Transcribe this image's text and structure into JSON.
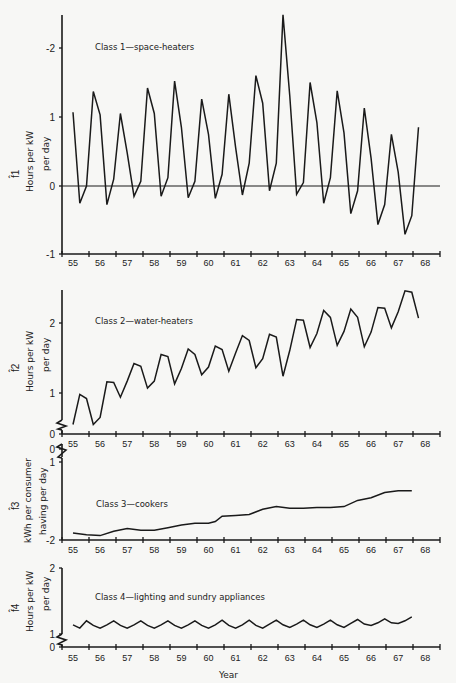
{
  "figure": {
    "xlabel": "Year",
    "years": [
      "55",
      "56",
      "57",
      "58",
      "59",
      "60",
      "61",
      "62",
      "63",
      "64",
      "65",
      "66",
      "67",
      "68"
    ]
  },
  "chart_data": [
    {
      "type": "line",
      "title": "Class 1—space-heaters",
      "ylabel": "Hours per kW per day",
      "ysymbol": "f̂1",
      "yticks": [
        "-2",
        "1",
        "0",
        "-1"
      ],
      "ytick_values": [
        2,
        1,
        0,
        -1
      ],
      "ylim": [
        -1,
        2.5
      ],
      "zero_line": true,
      "x": [
        55.0,
        55.25,
        55.5,
        55.75,
        56.0,
        56.25,
        56.5,
        56.75,
        57.0,
        57.25,
        57.5,
        57.75,
        58.0,
        58.25,
        58.5,
        58.75,
        59.0,
        59.25,
        59.5,
        59.75,
        60.0,
        60.25,
        60.5,
        60.75,
        61.0,
        61.25,
        61.5,
        61.75,
        62.0,
        62.25,
        62.5,
        62.75,
        63.0,
        63.25,
        63.5,
        63.75,
        64.0,
        64.25,
        64.5,
        64.75,
        65.0,
        65.25,
        65.5,
        65.75,
        66.0,
        66.25,
        66.5,
        66.75,
        67.0,
        67.25,
        67.5
      ],
      "values": [
        1.07,
        -0.25,
        0.0,
        1.37,
        1.03,
        -0.27,
        0.1,
        1.05,
        0.48,
        -0.15,
        0.07,
        1.42,
        1.05,
        -0.15,
        0.12,
        1.52,
        0.85,
        -0.17,
        0.07,
        1.26,
        0.75,
        -0.18,
        0.17,
        1.33,
        0.56,
        -0.13,
        0.33,
        1.6,
        1.2,
        -0.07,
        0.33,
        2.48,
        1.3,
        -0.12,
        0.05,
        1.5,
        0.92,
        -0.25,
        0.12,
        1.38,
        0.77,
        -0.4,
        -0.07,
        1.13,
        0.4,
        -0.56,
        -0.27,
        0.75,
        0.2,
        -0.7,
        -0.43,
        0.85
      ]
    },
    {
      "type": "line",
      "title": "Class 2—water-heaters",
      "ylabel": "Hours per kW per day",
      "ysymbol": "f̂2",
      "yticks": [
        "2",
        "1",
        "0"
      ],
      "ytick_values": [
        2,
        1,
        0
      ],
      "ylim": [
        0,
        2.5
      ],
      "broken_axis": true,
      "x": [
        55.0,
        55.25,
        55.5,
        55.75,
        56.0,
        56.25,
        56.5,
        56.75,
        57.0,
        57.25,
        57.5,
        57.75,
        58.0,
        58.25,
        58.5,
        58.75,
        59.0,
        59.25,
        59.5,
        59.75,
        60.0,
        60.25,
        60.5,
        60.75,
        61.0,
        61.25,
        61.5,
        61.75,
        62.0,
        62.25,
        62.5,
        62.75,
        63.0,
        63.25,
        63.5,
        63.75,
        64.0,
        64.25,
        64.5,
        64.75,
        65.0,
        65.25,
        65.5,
        65.75,
        66.0,
        66.25,
        66.5,
        66.75,
        67.0,
        67.25,
        67.5
      ],
      "values": [
        0.55,
        0.98,
        0.92,
        0.55,
        0.65,
        1.16,
        1.15,
        0.94,
        1.17,
        1.42,
        1.38,
        1.07,
        1.17,
        1.55,
        1.52,
        1.13,
        1.35,
        1.63,
        1.55,
        1.26,
        1.37,
        1.67,
        1.62,
        1.31,
        1.57,
        1.82,
        1.75,
        1.36,
        1.49,
        1.84,
        1.8,
        1.24,
        1.61,
        2.05,
        2.04,
        1.65,
        1.85,
        2.18,
        2.08,
        1.68,
        1.88,
        2.2,
        2.08,
        1.66,
        1.87,
        2.22,
        2.21,
        1.93,
        2.16,
        2.46,
        2.44,
        2.07
      ]
    },
    {
      "type": "line",
      "title": "Class 3—cookers",
      "ylabel": "kWh per consumer having per day",
      "ysymbol": "f̂3",
      "yticks": [
        "0",
        "1",
        "-2"
      ],
      "ytick_values": [
        0,
        1,
        2
      ],
      "ylim": [
        0,
        2
      ],
      "broken_axis": true,
      "x": [
        55.0,
        55.5,
        56.0,
        56.5,
        57.0,
        57.5,
        58.0,
        58.5,
        59.0,
        59.5,
        60.0,
        60.25,
        60.5,
        61.0,
        61.5,
        62.0,
        62.5,
        63.0,
        63.5,
        64.0,
        64.5,
        65.0,
        65.5,
        66.0,
        66.5,
        67.0,
        67.5
      ],
      "values": [
        1.08,
        1.06,
        1.05,
        1.1,
        1.13,
        1.11,
        1.11,
        1.14,
        1.17,
        1.19,
        1.19,
        1.21,
        1.27,
        1.28,
        1.29,
        1.35,
        1.38,
        1.36,
        1.36,
        1.37,
        1.37,
        1.38,
        1.45,
        1.48,
        1.54,
        1.56,
        1.56
      ]
    },
    {
      "type": "line",
      "title": "Class 4—lighting and sundry appliances",
      "ylabel": "Hours per kW per day",
      "ysymbol": "f̂4",
      "yticks": [
        "2",
        "1",
        "0"
      ],
      "ytick_values": [
        2,
        1,
        0
      ],
      "ylim": [
        0,
        2
      ],
      "broken_axis": true,
      "x": [
        55.0,
        55.25,
        55.5,
        55.75,
        56.0,
        56.25,
        56.5,
        56.75,
        57.0,
        57.25,
        57.5,
        57.75,
        58.0,
        58.25,
        58.5,
        58.75,
        59.0,
        59.25,
        59.5,
        59.75,
        60.0,
        60.25,
        60.5,
        60.75,
        61.0,
        61.25,
        61.5,
        61.75,
        62.0,
        62.25,
        62.5,
        62.75,
        63.0,
        63.25,
        63.5,
        63.75,
        64.0,
        64.25,
        64.5,
        64.75,
        65.0,
        65.25,
        65.5,
        65.75,
        66.0,
        66.25,
        66.5,
        66.75,
        67.0,
        67.25,
        67.5
      ],
      "values": [
        1.14,
        1.09,
        1.2,
        1.13,
        1.09,
        1.14,
        1.2,
        1.13,
        1.09,
        1.14,
        1.2,
        1.13,
        1.09,
        1.14,
        1.2,
        1.13,
        1.09,
        1.14,
        1.2,
        1.13,
        1.09,
        1.14,
        1.21,
        1.13,
        1.09,
        1.14,
        1.21,
        1.13,
        1.09,
        1.15,
        1.21,
        1.14,
        1.1,
        1.15,
        1.21,
        1.14,
        1.1,
        1.15,
        1.21,
        1.14,
        1.1,
        1.16,
        1.22,
        1.15,
        1.13,
        1.17,
        1.23,
        1.17,
        1.16,
        1.2,
        1.26
      ]
    }
  ]
}
